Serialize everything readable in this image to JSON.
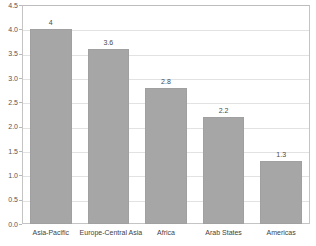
{
  "chart_data": {
    "type": "bar",
    "title": "",
    "xlabel": "",
    "ylabel": "",
    "categories": [
      "Asia-Pacific",
      "Europe-Central Asia",
      "Africa",
      "Arab States",
      "Americas"
    ],
    "values": [
      4,
      3.6,
      2.8,
      2.2,
      1.3
    ],
    "value_labels": [
      "4",
      "3.6",
      "2.8",
      "2.2",
      "1.3"
    ],
    "ylim": [
      0.0,
      4.5
    ],
    "ytick_labels": [
      "4.5",
      "4.0",
      "3.5",
      "3.0",
      "2.5",
      "2.0",
      "1.5",
      "1.0",
      "0.5",
      "0.0"
    ],
    "ytick_values": [
      4.5,
      4.0,
      3.5,
      3.0,
      2.5,
      2.0,
      1.5,
      1.0,
      0.5,
      0.0
    ],
    "grid": true,
    "legend": "none",
    "series": [
      {
        "name": "",
        "values": [
          4,
          3.6,
          2.8,
          2.2,
          1.3
        ]
      }
    ],
    "colors": {
      "bar_fill": "#a6a6a6",
      "bar_border": "#a0a0a0",
      "gridline": "#e2e2e2",
      "plot_border": "#c4c4c4",
      "background": "#ffffff",
      "tick_text": "#55555a",
      "label_text": "#3f3f3f"
    }
  }
}
